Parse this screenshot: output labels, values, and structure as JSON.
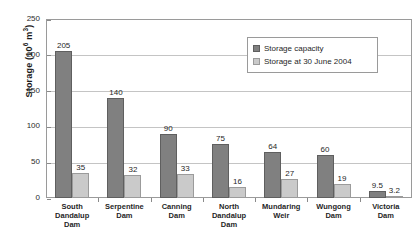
{
  "chart_data": {
    "type": "bar",
    "title": "",
    "xlabel": "",
    "ylabel": "Storage (10^6 m^3)",
    "ylabel_main": "Storage (10",
    "ylabel_exp": "6",
    "ylabel_tail": " m",
    "ylabel_exp2": "3",
    "ylabel_close": ")",
    "ylim": [
      0,
      250
    ],
    "yticks": [
      0,
      50,
      100,
      150,
      200,
      250
    ],
    "ytick_labels": [
      "0",
      "50",
      "100",
      "150",
      "200",
      "250"
    ],
    "grid": true,
    "legend_position": "top-right",
    "categories": [
      "South Dandalup Dam",
      "Serpentine Dam",
      "Canning Dam",
      "North Dandalup Dam",
      "Mundaring Weir",
      "Wungong Dam",
      "Victoria Dam"
    ],
    "category_lines": [
      [
        "South",
        "Dandalup",
        "Dam"
      ],
      [
        "Serpentine",
        "Dam"
      ],
      [
        "Canning",
        "Dam"
      ],
      [
        "North",
        "Dandalup",
        "Dam"
      ],
      [
        "Mundaring",
        "Weir"
      ],
      [
        "Wungong",
        "Dam"
      ],
      [
        "Victoria",
        "Dam"
      ]
    ],
    "series": [
      {
        "name": "Storage capacity",
        "color": "#808080",
        "values": [
          205,
          140,
          90,
          75,
          64,
          60,
          9.5
        ],
        "labels": [
          "205",
          "140",
          "90",
          "75",
          "64",
          "60",
          "9.5"
        ]
      },
      {
        "name": "Storage at 30 June 2004",
        "color": "#cacaca",
        "values": [
          35,
          32,
          33,
          16,
          27,
          19,
          3.2
        ],
        "labels": [
          "35",
          "32",
          "33",
          "16",
          "27",
          "19",
          "3.2"
        ]
      }
    ]
  },
  "legend": {
    "items": [
      {
        "label": "Storage capacity",
        "swatch": "cap"
      },
      {
        "label": "Storage at 30 June 2004",
        "swatch": "cur"
      }
    ]
  }
}
